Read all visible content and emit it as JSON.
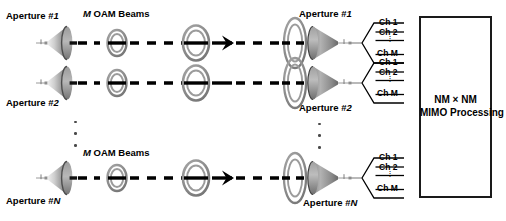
{
  "figure": {
    "type": "system-architecture-block-diagram"
  },
  "colors": {
    "line": "#000000",
    "ring": "#8a8a8a",
    "ring_dark": "#6e6e6e",
    "dish_light": "#d8d8d8",
    "dish_mid": "#a8a8a8",
    "dish_dark": "#6a6a6a",
    "dot": "#4a4a4a",
    "box_border": "#1a1a1a",
    "background": "#ffffff"
  },
  "transmit": {
    "beams_label_prefix": "M",
    "beams_label_rest": " OAM Beams",
    "apertures": [
      {
        "label_prefix": "Aperture #",
        "label_index": "1"
      },
      {
        "label_prefix": "Aperture #",
        "label_index": "2"
      },
      {
        "label_prefix": "Aperture #",
        "label_index": "N"
      }
    ],
    "vertical_ellipsis": "3 dots"
  },
  "receive": {
    "apertures": [
      {
        "label_prefix": "Aperture #",
        "label_index": "1"
      },
      {
        "label_prefix": "Aperture #",
        "label_index": "2"
      },
      {
        "label_prefix": "Aperture #",
        "label_index": "N"
      }
    ],
    "vertical_ellipsis": "3 dots"
  },
  "channel_groups": [
    {
      "channels": [
        "Ch 1",
        "Ch 2",
        "Ch M"
      ],
      "ellipsis": "⋮"
    },
    {
      "channels": [
        "Ch 1",
        "Ch 2",
        "Ch M"
      ],
      "ellipsis": "⋮"
    },
    {
      "channels": [
        "Ch 1",
        "Ch 2",
        "Ch M"
      ],
      "ellipsis": "⋮"
    }
  ],
  "processing_block": {
    "line1": "NM × NM",
    "line2": "MIMO Processing"
  }
}
